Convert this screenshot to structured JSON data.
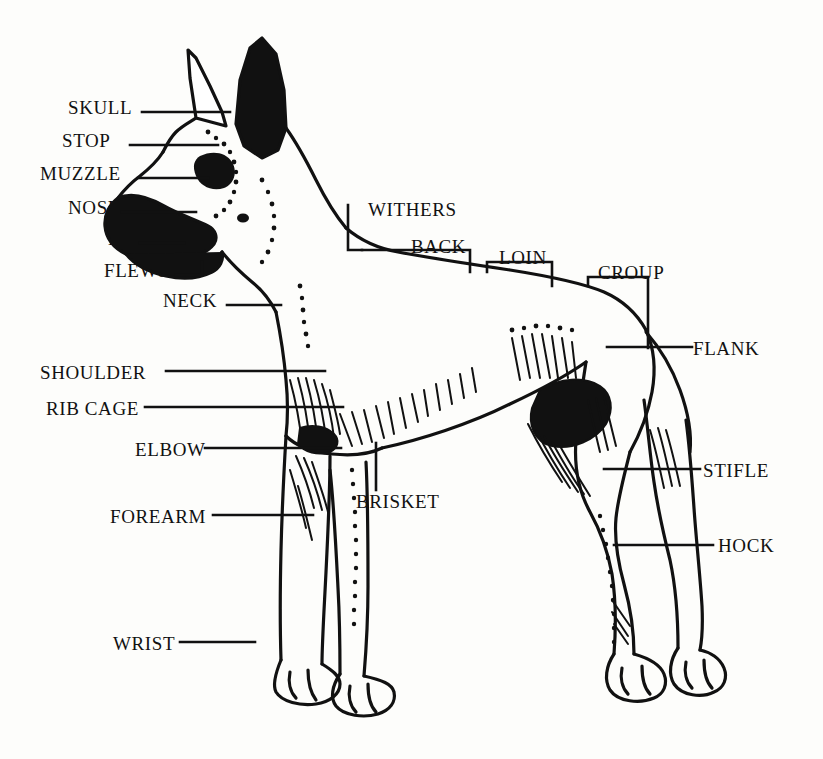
{
  "figure": {
    "breed_depiction": "great-dane-cropped-ears",
    "background_color": "#fdfdfb",
    "ink_color": "#111111",
    "width": 823,
    "height": 759
  },
  "labels": [
    {
      "id": "skull",
      "text": "SKULL",
      "x": 68,
      "y": 112,
      "align": "left"
    },
    {
      "id": "stop",
      "text": "STOP",
      "x": 62,
      "y": 145,
      "align": "left"
    },
    {
      "id": "muzzle",
      "text": "MUZZLE",
      "x": 40,
      "y": 178,
      "align": "left"
    },
    {
      "id": "nose",
      "text": "NOSE",
      "x": 68,
      "y": 212,
      "align": "left"
    },
    {
      "id": "lip",
      "text": "LIP",
      "x": 108,
      "y": 243,
      "align": "left"
    },
    {
      "id": "flews",
      "text": "FLEWS",
      "x": 104,
      "y": 275,
      "align": "left"
    },
    {
      "id": "neck",
      "text": "NECK",
      "x": 163,
      "y": 305,
      "align": "left"
    },
    {
      "id": "withers",
      "text": "WITHERS",
      "x": 368,
      "y": 214,
      "align": "left"
    },
    {
      "id": "back",
      "text": "BACK",
      "x": 411,
      "y": 251,
      "align": "left"
    },
    {
      "id": "loin",
      "text": "LOIN",
      "x": 499,
      "y": 262,
      "align": "left"
    },
    {
      "id": "croup",
      "text": "CROUP",
      "x": 598,
      "y": 277,
      "align": "left"
    },
    {
      "id": "flank",
      "text": "FLANK",
      "x": 693,
      "y": 353,
      "align": "left"
    },
    {
      "id": "shoulder",
      "text": "SHOULDER",
      "x": 40,
      "y": 377,
      "align": "left"
    },
    {
      "id": "rib-cage",
      "text": "RIB CAGE",
      "x": 46,
      "y": 413,
      "align": "left"
    },
    {
      "id": "elbow",
      "text": "ELBOW",
      "x": 135,
      "y": 454,
      "align": "left"
    },
    {
      "id": "brisket",
      "text": "BRISKET",
      "x": 356,
      "y": 506,
      "align": "left"
    },
    {
      "id": "forearm",
      "text": "FOREARM",
      "x": 110,
      "y": 521,
      "align": "left"
    },
    {
      "id": "stifle",
      "text": "STIFLE",
      "x": 703,
      "y": 475,
      "align": "left"
    },
    {
      "id": "hock",
      "text": "HOCK",
      "x": 718,
      "y": 550,
      "align": "left"
    },
    {
      "id": "wrist",
      "text": "WRIST",
      "x": 113,
      "y": 648,
      "align": "left"
    }
  ],
  "leaders": {
    "skull": {
      "type": "line",
      "points": "142,112 230,112"
    },
    "stop": {
      "type": "line",
      "points": "130,145 218,145"
    },
    "muzzle": {
      "type": "line",
      "points": "138,178 208,178"
    },
    "nose": {
      "type": "line",
      "points": "122,212 196,212"
    },
    "lip": {
      "type": "line",
      "points": "140,243 184,243"
    },
    "flews": {
      "type": "bracket",
      "points": "176,275 202,275 202,262"
    },
    "neck": {
      "type": "line",
      "points": "227,305 281,305"
    },
    "withers": {
      "type": "bracket",
      "points": "348,205 348,250 362,250"
    },
    "back": {
      "type": "bracket",
      "points": "362,250 470,250 470,272"
    },
    "loin": {
      "type": "bracket",
      "points": "487,272 487,262 552,262 552,286"
    },
    "croup": {
      "type": "bracket",
      "points": "588,286 588,277 648,277 648,348"
    },
    "flank": {
      "type": "line",
      "points": "607,347 692,347"
    },
    "shoulder": {
      "type": "line",
      "points": "166,371 325,371"
    },
    "rib-cage": {
      "type": "line",
      "points": "145,407 343,407"
    },
    "elbow": {
      "type": "line",
      "points": "205,448 341,448"
    },
    "brisket": {
      "type": "line",
      "points": "376,490 376,443"
    },
    "forearm": {
      "type": "line",
      "points": "213,515 313,515"
    },
    "stifle": {
      "type": "line",
      "points": "604,469 700,469"
    },
    "hock": {
      "type": "line",
      "points": "614,545 713,545"
    },
    "wrist": {
      "type": "line",
      "points": "180,642 255,642"
    }
  }
}
